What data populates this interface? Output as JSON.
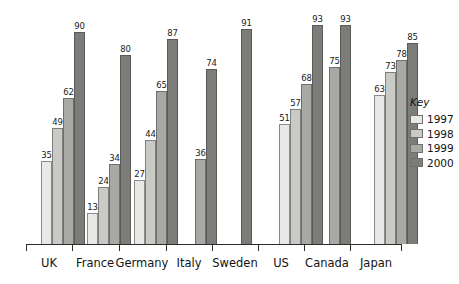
{
  "chart_data": {
    "type": "bar",
    "title": "",
    "subtitle": "",
    "xlabel": "",
    "ylabel": "",
    "ylim": [
      0,
      100
    ],
    "grid": false,
    "legend_position": "right",
    "legend_title": "Key",
    "categories": [
      "UK",
      "France",
      "Germany",
      "Italy",
      "Sweden",
      "US",
      "Canada",
      "Japan"
    ],
    "series": [
      {
        "name": "1997",
        "color": "#e8e8e6",
        "values": [
          35,
          13,
          27,
          null,
          null,
          51,
          null,
          63
        ]
      },
      {
        "name": "1998",
        "color": "#c9c9c5",
        "values": [
          49,
          24,
          44,
          null,
          null,
          57,
          null,
          73
        ]
      },
      {
        "name": "1999",
        "color": "#a8a8a4",
        "values": [
          62,
          34,
          65,
          36,
          null,
          68,
          75,
          78
        ]
      },
      {
        "name": "2000",
        "color": "#7c7c79",
        "values": [
          90,
          80,
          87,
          74,
          91,
          93,
          93,
          85
        ]
      }
    ]
  },
  "legend": {
    "title": "Key",
    "entries": [
      {
        "label": "1997",
        "swatch_class": "y1997"
      },
      {
        "label": "1998",
        "swatch_class": "y1998"
      },
      {
        "label": "1999",
        "swatch_class": "y1999"
      },
      {
        "label": "2000",
        "swatch_class": "y2000"
      }
    ]
  },
  "axis": {
    "categories": [
      "UK",
      "France",
      "Germany",
      "Italy",
      "Sweden",
      "US",
      "Canada",
      "Japan"
    ]
  }
}
